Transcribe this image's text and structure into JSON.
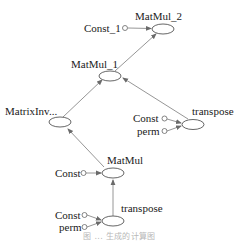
{
  "diagram": {
    "type": "computation-graph",
    "nodes": [
      {
        "id": "MatMul_2",
        "label": "MatMul_2",
        "kind": "op"
      },
      {
        "id": "Const_1",
        "label": "Const_1",
        "kind": "const"
      },
      {
        "id": "MatMul_1",
        "label": "MatMul_1",
        "kind": "op"
      },
      {
        "id": "MatrixInv",
        "label": "MatrixInv...",
        "kind": "op"
      },
      {
        "id": "transpose_top",
        "label": "transpose",
        "kind": "op"
      },
      {
        "id": "Const_top",
        "label": "Const",
        "kind": "const"
      },
      {
        "id": "perm_top",
        "label": "perm",
        "kind": "const"
      },
      {
        "id": "MatMul",
        "label": "MatMul",
        "kind": "op"
      },
      {
        "id": "Const_mid",
        "label": "Const",
        "kind": "const"
      },
      {
        "id": "transpose_bottom",
        "label": "transpose",
        "kind": "op"
      },
      {
        "id": "Const_bottom",
        "label": "Const",
        "kind": "const"
      },
      {
        "id": "perm_bottom",
        "label": "perm",
        "kind": "const"
      }
    ],
    "edges": [
      {
        "from": "Const_1",
        "to": "MatMul_2"
      },
      {
        "from": "MatMul_1",
        "to": "MatMul_2"
      },
      {
        "from": "MatrixInv",
        "to": "MatMul_1"
      },
      {
        "from": "transpose_top",
        "to": "MatMul_1"
      },
      {
        "from": "Const_top",
        "to": "transpose_top"
      },
      {
        "from": "perm_top",
        "to": "transpose_top"
      },
      {
        "from": "MatMul",
        "to": "MatrixInv"
      },
      {
        "from": "Const_mid",
        "to": "MatMul"
      },
      {
        "from": "transpose_bottom",
        "to": "MatMul"
      },
      {
        "from": "Const_bottom",
        "to": "transpose_bottom"
      },
      {
        "from": "perm_bottom",
        "to": "transpose_bottom"
      }
    ],
    "colors": {
      "edge": "#8a8a8a",
      "node_stroke": "#555555",
      "text": "#1a1a1a",
      "caption": "#b8b8b8"
    }
  },
  "labels": {
    "matmul_2": "MatMul_2",
    "const_1": "Const_1",
    "matmul_1": "MatMul_1",
    "matrixinv": "MatrixInv...",
    "transpose_top": "transpose",
    "const_top": "Const",
    "perm_top": "perm",
    "matmul": "MatMul",
    "const_mid": "Const",
    "transpose_bottom": "transpose",
    "const_bottom": "Const",
    "perm_bottom": "perm"
  },
  "caption": "图 ... 生成的计算图"
}
